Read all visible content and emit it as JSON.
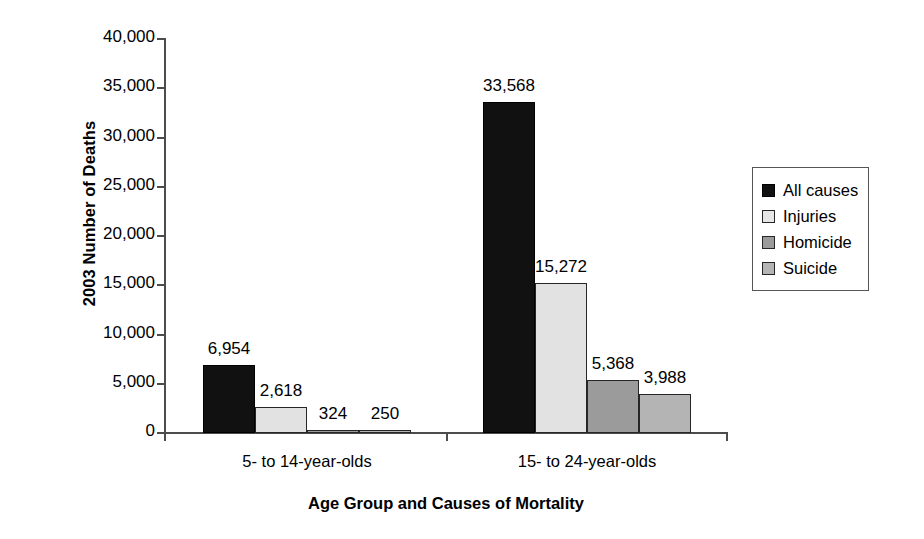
{
  "chart_data": {
    "type": "bar",
    "title": "",
    "xlabel": "Age Group and Causes of Mortality",
    "ylabel": "2003 Number of Deaths",
    "ylim": [
      0,
      40000
    ],
    "ytick_labels": [
      "0",
      "5,000",
      "10,000",
      "15,000",
      "20,000",
      "25,000",
      "30,000",
      "35,000",
      "40,000"
    ],
    "ytick_values": [
      0,
      5000,
      10000,
      15000,
      20000,
      25000,
      30000,
      35000,
      40000
    ],
    "grid": false,
    "legend_position": "right",
    "categories": [
      "5- to 14-year-olds",
      "15- to 24-year-olds"
    ],
    "series": [
      {
        "name": "All causes",
        "color": "#111111",
        "values": [
          6954,
          33568
        ],
        "labels": [
          "6,954",
          "33,568"
        ]
      },
      {
        "name": "Injuries",
        "color": "#e2e2e2",
        "values": [
          2618,
          15272
        ],
        "labels": [
          "2,618",
          "15,272"
        ]
      },
      {
        "name": "Homicide",
        "color": "#9b9b9b",
        "values": [
          324,
          5368
        ],
        "labels": [
          "324",
          "5,368"
        ]
      },
      {
        "name": "Suicide",
        "color": "#b4b4b4",
        "values": [
          250,
          3988
        ],
        "labels": [
          "250",
          "3,988"
        ]
      }
    ]
  },
  "legend": {
    "items": [
      {
        "label": "All causes"
      },
      {
        "label": "Injuries"
      },
      {
        "label": "Homicide"
      },
      {
        "label": "Suicide"
      }
    ]
  }
}
